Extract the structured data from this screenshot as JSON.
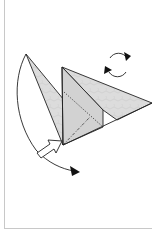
{
  "diagram": {
    "type": "origami-fold-step",
    "colors": {
      "paper_fill": "#d9d9d9",
      "paper_fill_light": "#e6e6e6",
      "stroke": "#222222",
      "frame": "#c8c8c8",
      "background": "#ffffff"
    },
    "symbols": [
      {
        "name": "rotate-over-icon",
        "meaning": "turn model over"
      },
      {
        "name": "push-arrow-icon",
        "meaning": "push / sink at hinge"
      },
      {
        "name": "swing-fold-arrow-icon",
        "meaning": "swing flap around"
      }
    ],
    "lines": [
      {
        "kind": "dotted",
        "meaning": "hidden edge"
      },
      {
        "kind": "dash-dot",
        "meaning": "fold line"
      }
    ]
  }
}
